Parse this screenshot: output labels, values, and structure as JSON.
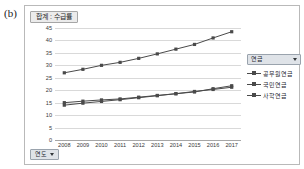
{
  "panel": {
    "label": "(b)"
  },
  "chart_title_button": {
    "label": "합계 : 수급률",
    "name": "chart-title-field-button"
  },
  "legend": {
    "header_label": "연금",
    "filter_icon": "filter-dropdown-icon",
    "position": "right",
    "items": [
      {
        "label": "공무원연금",
        "color": "#4a4a4a",
        "marker": "square"
      },
      {
        "label": "국민연금",
        "color": "#4a4a4a",
        "marker": "square"
      },
      {
        "label": "사학연금",
        "color": "#4a4a4a",
        "marker": "square"
      }
    ]
  },
  "category_field_button": {
    "label": "연도",
    "filter_icon": "filter-dropdown-icon"
  },
  "chart_data": {
    "type": "line",
    "title": "합계 : 수급률",
    "xlabel": "연도",
    "ylabel": "",
    "categories": [
      "2008",
      "2009",
      "2010",
      "2011",
      "2012",
      "2013",
      "2014",
      "2015",
      "2016",
      "2017"
    ],
    "ylim": [
      0,
      45
    ],
    "yticks": [
      0,
      5,
      10,
      15,
      20,
      25,
      30,
      35,
      40,
      45
    ],
    "grid": true,
    "legend_position": "right",
    "series": [
      {
        "name": "공무원연금",
        "color": "#4a4a4a",
        "values": [
          27.0,
          28.4,
          30.0,
          31.2,
          32.8,
          34.6,
          36.5,
          38.4,
          41.0,
          43.5
        ]
      },
      {
        "name": "국민연금",
        "color": "#4a4a4a",
        "values": [
          15.0,
          15.6,
          16.1,
          16.5,
          17.2,
          17.9,
          18.6,
          19.3,
          20.6,
          21.8
        ]
      },
      {
        "name": "사학연금",
        "color": "#4a4a4a",
        "values": [
          14.0,
          14.8,
          15.5,
          16.2,
          17.0,
          17.8,
          18.6,
          19.5,
          20.3,
          21.2
        ]
      }
    ]
  }
}
